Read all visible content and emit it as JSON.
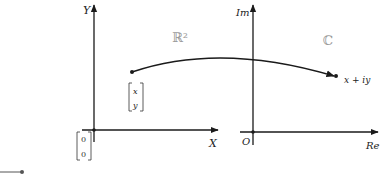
{
  "diagram": {
    "left_panel": {
      "space_label": "ℝ²",
      "y_axis_label": "Y",
      "x_axis_label": "X",
      "point_vector": {
        "top": "x",
        "bottom": "y"
      },
      "origin_vector": {
        "top": "0",
        "bottom": "0"
      }
    },
    "right_panel": {
      "space_label": "ℂ",
      "y_axis_label": "Im",
      "x_axis_label": "Re",
      "origin_label": "O",
      "point_label": "x + iy"
    },
    "mapping": "arrow from vector [x, y] in R^2 to complex number x + iy in C",
    "colors": {
      "axes": "#1a1a1a",
      "space_labels": "#9a9a9a",
      "text": "#222222"
    }
  }
}
